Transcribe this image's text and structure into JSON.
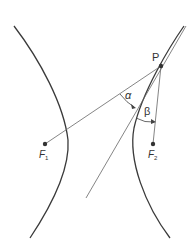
{
  "diagram": {
    "labels": {
      "P": "P",
      "F1_main": "F",
      "F1_sub": "1",
      "F2_main": "F",
      "F2_sub": "2",
      "alpha": "α",
      "beta": "β"
    },
    "points": {
      "P": [
        161,
        66
      ],
      "F1": [
        45,
        144
      ],
      "F2": [
        153,
        144
      ]
    },
    "colors": {
      "curve": "#3a3a3a",
      "line": "#555555",
      "point": "#333333"
    }
  }
}
